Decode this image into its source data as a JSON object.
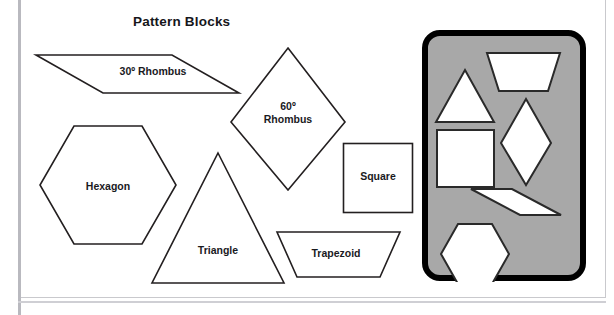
{
  "page": {
    "title": "Pattern Blocks",
    "background_color": "#ffffff",
    "frame_color": "#c9c9cd"
  },
  "shapes": [
    {
      "id": "rhombus-30",
      "label": "30º Rhombus",
      "label_lines": [
        "30º Rhombus"
      ],
      "kind": "parallelogram",
      "stroke": "#231f20",
      "fill": "#ffffff"
    },
    {
      "id": "rhombus-60",
      "label": "60º Rhombus",
      "label_lines": [
        "60º",
        "Rhombus"
      ],
      "kind": "rhombus",
      "stroke": "#231f20",
      "fill": "#ffffff"
    },
    {
      "id": "hexagon",
      "label": "Hexagon",
      "label_lines": [
        "Hexagon"
      ],
      "kind": "hexagon",
      "stroke": "#231f20",
      "fill": "#ffffff"
    },
    {
      "id": "triangle",
      "label": "Triangle",
      "label_lines": [
        "Triangle"
      ],
      "kind": "triangle",
      "stroke": "#231f20",
      "fill": "#ffffff"
    },
    {
      "id": "square",
      "label": "Square",
      "label_lines": [
        "Square"
      ],
      "kind": "square",
      "stroke": "#231f20",
      "fill": "#ffffff"
    },
    {
      "id": "trapezoid",
      "label": "Trapezoid",
      "label_lines": [
        "Trapezoid"
      ],
      "kind": "trapezoid",
      "stroke": "#231f20",
      "fill": "#ffffff"
    }
  ],
  "labels": {
    "rhombus30": "30º Rhombus",
    "rhombus60_line1": "60º",
    "rhombus60_line2": "Rhombus",
    "hexagon": "Hexagon",
    "triangle": "Triangle",
    "square": "Square",
    "trapezoid": "Trapezoid"
  },
  "tray": {
    "name": "pattern-block-tray",
    "fill_color": "#a8a8a8",
    "border_color": "#000000",
    "cutouts": [
      {
        "id": "tray-trapezoid",
        "shape": "trapezoid"
      },
      {
        "id": "tray-triangle",
        "shape": "triangle"
      },
      {
        "id": "tray-rhombus-60",
        "shape": "rhombus"
      },
      {
        "id": "tray-square",
        "shape": "square"
      },
      {
        "id": "tray-rhombus-30",
        "shape": "parallelogram"
      },
      {
        "id": "tray-hexagon",
        "shape": "hexagon"
      }
    ]
  }
}
